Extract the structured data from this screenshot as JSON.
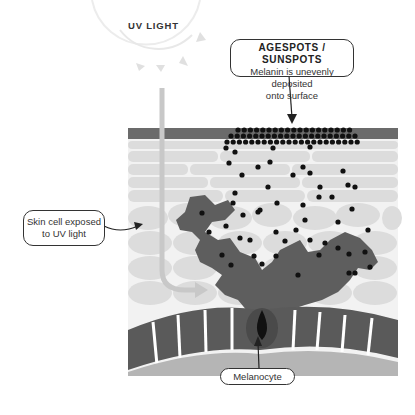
{
  "diagram": {
    "sun_label": "UV LIGHT",
    "callouts": {
      "agespots": {
        "title": "AGESPOTS / SUNSPOTS",
        "line1": "Melanin is unevenly deposited",
        "line2": "onto surface"
      },
      "skin_cell": {
        "line1": "Skin cell exposed",
        "line2": "to UV light"
      },
      "melanocyte": {
        "label": "Melanocyte"
      }
    },
    "colors": {
      "stratum_corneum": "#6b6b6b",
      "epidermis_cells": "#dcdcdc",
      "melanocyte_body": "#5e5e5e",
      "melanin": "#111111",
      "basal_cells": "#5a5a5a",
      "dermis": "#b5b5b5",
      "uv_ray": "#c8c8c8"
    }
  }
}
